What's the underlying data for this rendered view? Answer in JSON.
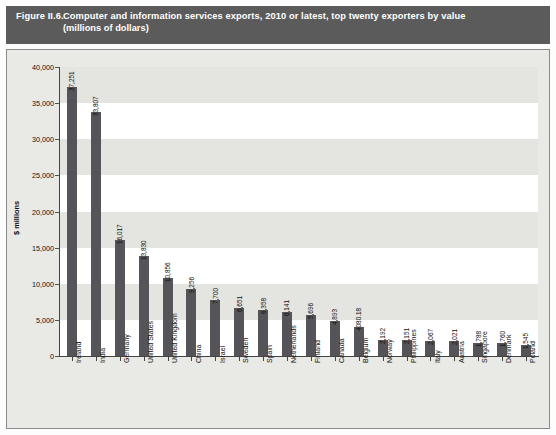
{
  "figure": {
    "number": "Figure II.6.",
    "title_line1": "Computer and information services exports, 2010 or latest, top twenty exporters by value",
    "title_line2": "(millions of dollars)",
    "header_bg": "#5b5b5b",
    "bar_color": "#555458",
    "plot_bg": "#ffffff",
    "frame_bg": "#e9e9e6",
    "band_color": "#e4e4e1"
  },
  "chart_data": {
    "type": "bar",
    "xlabel": "",
    "ylabel": "$ millions",
    "ylim": [
      0,
      40000
    ],
    "yticks": [
      0,
      5000,
      10000,
      15000,
      20000,
      25000,
      30000,
      35000,
      40000
    ],
    "ytick_labels": [
      "0",
      "5,000",
      "10,000",
      "15,000",
      "20,000",
      "25,000",
      "30,000",
      "35,000",
      "40,000"
    ],
    "grid": false,
    "legend": "none",
    "categories": [
      "Ireland",
      "India",
      "Germany",
      "United States",
      "United Kingdom",
      "China",
      "Israel",
      "Sweden",
      "Spain",
      "Netherlands",
      "Finland",
      "Canada",
      "Belgium",
      "Norway",
      "Philippines",
      "Italy",
      "Austria",
      "Singapore",
      "Denmark",
      "Poland"
    ],
    "values": [
      37251,
      33807,
      16017,
      13830,
      10856,
      9256,
      7700,
      6651,
      6358,
      6141,
      5696,
      4893,
      4080.18,
      2192,
      2151,
      2067,
      2021,
      1788,
      1760,
      1545
    ],
    "value_labels": [
      "37,251",
      "33,807",
      "16,017",
      "13,830",
      "10,856",
      "9,256",
      "7,700",
      "6,651",
      "6,358",
      "6,141",
      "5,696",
      "4,893",
      "4080.18",
      "2,192",
      "2,151",
      "2,067",
      "2,021",
      "1,788",
      "1,760",
      "1,545"
    ]
  }
}
